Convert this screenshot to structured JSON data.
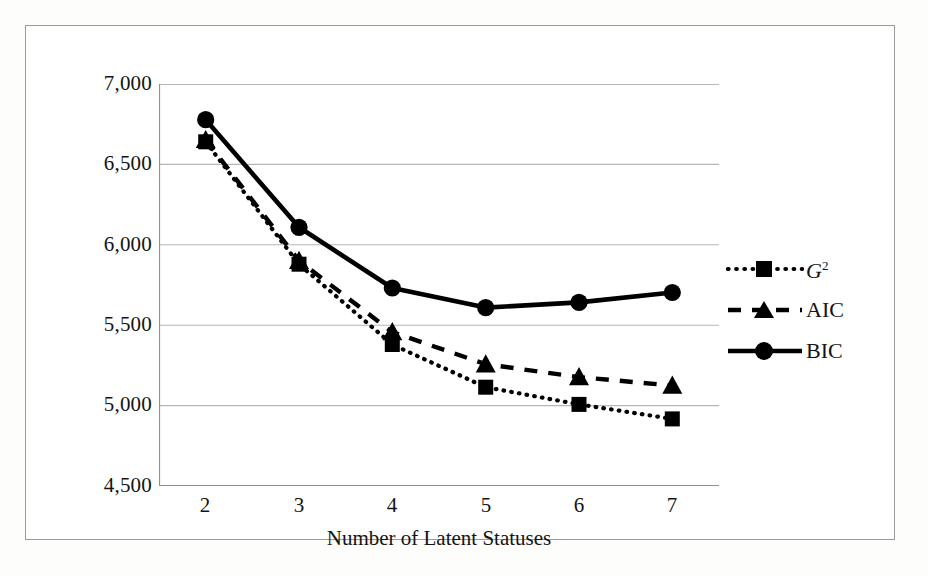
{
  "chart_data": {
    "type": "line",
    "title": "",
    "xlabel": "Number of Latent Statuses",
    "ylabel": "",
    "categories": [
      "2",
      "3",
      "4",
      "5",
      "6",
      "7"
    ],
    "x": [
      2,
      3,
      4,
      5,
      6,
      7
    ],
    "xlim": [
      1.5,
      7.5
    ],
    "ylim": [
      4500,
      7000
    ],
    "yticks": [
      "7,000",
      "6,500",
      "6,000",
      "5,500",
      "5,000",
      "4,500"
    ],
    "ytick_values": [
      7000,
      6500,
      6000,
      5500,
      5000,
      4500
    ],
    "xticks": [
      "2",
      "3",
      "4",
      "5",
      "6",
      "7"
    ],
    "grid": "horizontal",
    "legend_position": "right",
    "series": [
      {
        "name": "G2",
        "label": "G",
        "label_sup": "2",
        "marker": "square",
        "linestyle": "dotted",
        "color": "#000000",
        "values": [
          6640,
          5878,
          5378,
          5112,
          5005,
          4915
        ]
      },
      {
        "name": "AIC",
        "label": "AIC",
        "marker": "triangle",
        "linestyle": "dashed",
        "color": "#000000",
        "values": [
          6652,
          5900,
          5455,
          5255,
          5175,
          5122
        ]
      },
      {
        "name": "BIC",
        "label": "BIC",
        "marker": "circle",
        "linestyle": "solid",
        "color": "#000000",
        "values": [
          6778,
          6108,
          5730,
          5608,
          5640,
          5702
        ]
      }
    ]
  },
  "legend": {
    "items": [
      {
        "label": "G",
        "sup": "2",
        "marker": "square",
        "style": "dotted"
      },
      {
        "label": "AIC",
        "sup": "",
        "marker": "triangle",
        "style": "dashed"
      },
      {
        "label": "BIC",
        "sup": "",
        "marker": "circle",
        "style": "solid"
      }
    ]
  },
  "axis": {
    "x_title": "Number of Latent Statuses"
  },
  "colors": {
    "line": "#000000",
    "grid": "#b6b6b6",
    "axis": "#8f8f8f",
    "frame": "#9a9a9a",
    "text": "#141414",
    "background": "#ffffff"
  }
}
